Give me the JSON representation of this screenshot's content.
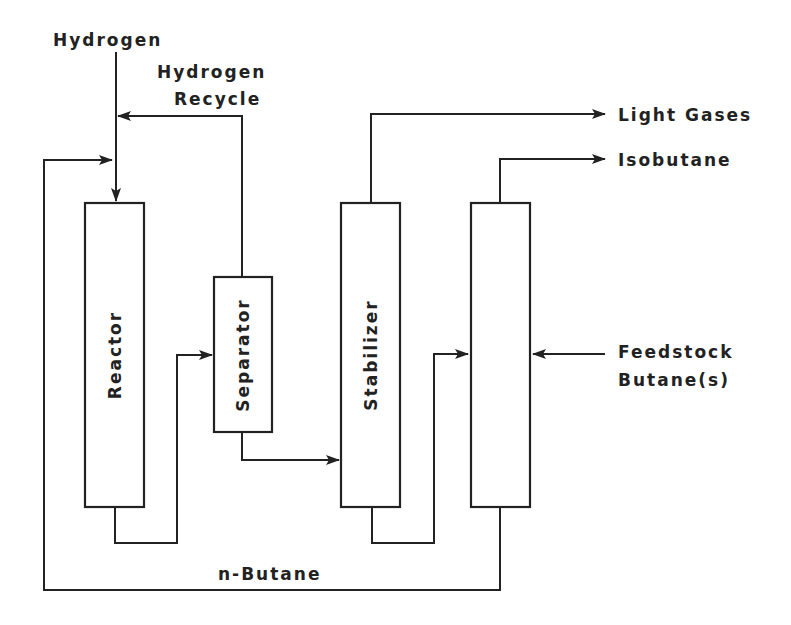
{
  "diagram": {
    "type": "process-flow",
    "units": [
      {
        "id": "reactor",
        "label": "Reactor"
      },
      {
        "id": "separator",
        "label": "Separator"
      },
      {
        "id": "stabilizer",
        "label": "Stabilizer"
      },
      {
        "id": "column",
        "label": ""
      }
    ],
    "streams": {
      "hydrogen": "Hydrogen",
      "hydrogen_recycle_line1": "Hydrogen",
      "hydrogen_recycle_line2": "Recycle",
      "light_gases": "Light Gases",
      "isobutane": "Isobutane",
      "feedstock_line1": "Feedstock",
      "feedstock_line2": "Butane(s)",
      "n_butane": "n-Butane"
    },
    "colors": {
      "stroke": "#222222",
      "background": "#ffffff"
    }
  }
}
